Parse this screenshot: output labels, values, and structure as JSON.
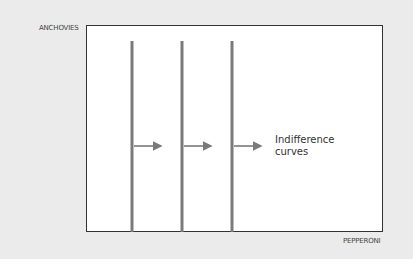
{
  "axes": {
    "y_label": "ANCHOVIES",
    "x_label": "PEPPERONI"
  },
  "annotation": {
    "line1": "Indifference",
    "line2": "curves"
  },
  "curves": [
    {
      "x": 132,
      "y_top": 41,
      "y_bottom": 232
    },
    {
      "x": 182,
      "y_top": 41,
      "y_bottom": 232
    },
    {
      "x": 232,
      "y_top": 41,
      "y_bottom": 232
    }
  ],
  "arrows": [
    {
      "x1": 134,
      "x2": 165,
      "y": 146
    },
    {
      "x1": 184,
      "x2": 215,
      "y": 146
    },
    {
      "x1": 234,
      "x2": 265,
      "y": 146
    }
  ],
  "colors": {
    "background": "#ebebeb",
    "plot": "#ffffff",
    "border": "#333333",
    "curve": "#7a7a7a"
  }
}
